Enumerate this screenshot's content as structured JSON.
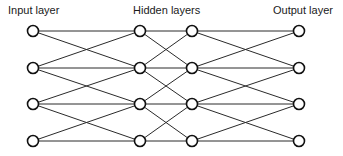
{
  "diagram": {
    "labels": {
      "input": "Input layer",
      "hidden": "Hidden layers",
      "output": "Output layer"
    },
    "layers": [
      {
        "name": "input",
        "x": 33,
        "nodes": [
          31,
          68,
          104,
          141
        ]
      },
      {
        "name": "hidden-1",
        "x": 140,
        "nodes": [
          31,
          68,
          104,
          141
        ]
      },
      {
        "name": "hidden-2",
        "x": 192,
        "nodes": [
          31,
          68,
          104,
          141
        ]
      },
      {
        "name": "output",
        "x": 299,
        "nodes": [
          31,
          68,
          104,
          141
        ]
      }
    ],
    "connection_pattern": "each node connects to same row and adjacent rows (±1) in next layer",
    "node_radius": 5.5,
    "colors": {
      "edge": "#2a2a2a",
      "node_stroke": "#111111",
      "node_fill": "#ffffff",
      "text": "#1a1a1a"
    }
  }
}
